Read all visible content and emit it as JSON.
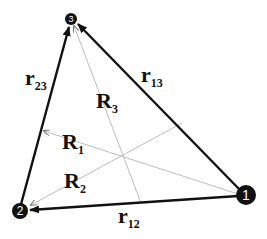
{
  "diagram": {
    "type": "triangle-vector-diagram",
    "nodes": [
      {
        "id": "1",
        "label": "1"
      },
      {
        "id": "2",
        "label": "2"
      },
      {
        "id": "3",
        "label": "3"
      }
    ],
    "edges": [
      {
        "id": "r12",
        "main": "r",
        "sub": "12"
      },
      {
        "id": "r13",
        "main": "r",
        "sub": "13"
      },
      {
        "id": "r23",
        "main": "r",
        "sub": "23"
      }
    ],
    "medians": [
      {
        "id": "R1",
        "main": "R",
        "sub": "1"
      },
      {
        "id": "R2",
        "main": "R",
        "sub": "2"
      },
      {
        "id": "R3",
        "main": "R",
        "sub": "3"
      }
    ],
    "colors": {
      "edge": "#111111",
      "median": "#b8b8b8",
      "node": "#111111"
    }
  }
}
